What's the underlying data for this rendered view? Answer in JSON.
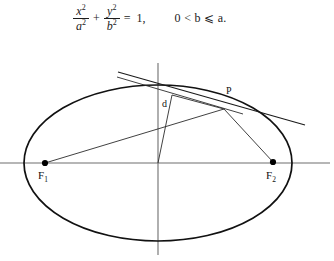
{
  "equation": {
    "x_numerator": "x",
    "x_numerator_exp": "2",
    "x_denominator": "a",
    "x_denominator_exp": "2",
    "plus": "+",
    "y_numerator": "y",
    "y_numerator_exp": "2",
    "y_denominator": "b",
    "y_denominator_exp": "2",
    "equals": "=",
    "rhs": "1,",
    "condition": "0 < b ⩽ a."
  },
  "figure": {
    "labels": {
      "focus_left": "F",
      "focus_left_sub": "1",
      "focus_right": "F",
      "focus_right_sub": "2",
      "point_p": "P",
      "distance_d": "d"
    },
    "colors": {
      "curve": "#111111",
      "axis": "#6e6e6e",
      "ray": "#2b2b2b",
      "dot": "#000000"
    },
    "geometry": {
      "center": [
        158,
        117
      ],
      "semi_major_a": 134,
      "semi_minor_b": 78,
      "focus_left": [
        45,
        117
      ],
      "focus_right": [
        273,
        116
      ],
      "point_p": [
        224,
        63
      ],
      "perp_foot": [
        172,
        50
      ],
      "tangent_start": [
        118,
        27
      ],
      "tangent_end": [
        305,
        79
      ],
      "chord_start": [
        118,
        32
      ],
      "chord_end": [
        238,
        67
      ],
      "x_axis": [
        0,
        117,
        330,
        117
      ],
      "y_axis": [
        158,
        17,
        158,
        209
      ]
    }
  }
}
